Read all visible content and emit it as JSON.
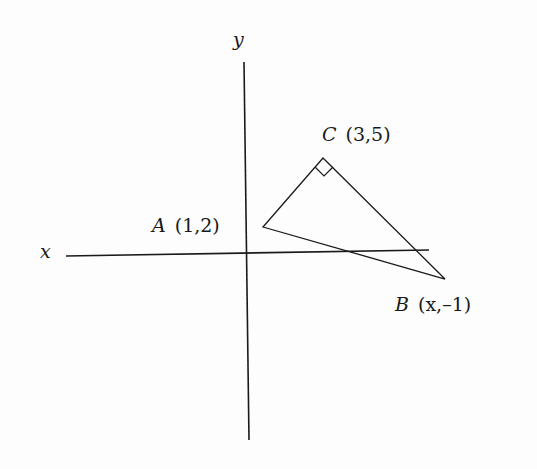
{
  "diagram": {
    "type": "coordinate-geometry",
    "axes": {
      "x_label": "x",
      "y_label": "y"
    },
    "points": {
      "A": {
        "name": "A",
        "coords": "(1,2)"
      },
      "B": {
        "name": "B",
        "coords": "(x,–1)"
      },
      "C": {
        "name": "C",
        "coords": "(3,5)"
      }
    },
    "right_angle_at": "C",
    "stroke_color": "#1a1a1a",
    "background": "#fdfdfd"
  }
}
